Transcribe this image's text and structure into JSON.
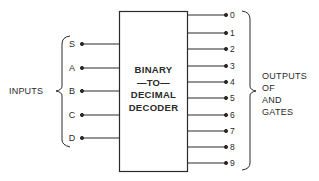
{
  "decoder": {
    "title_lines": [
      "BINARY",
      "—TO—",
      "DECIMAL",
      "DECODER"
    ]
  },
  "inputs": {
    "group_label": "INPUTS",
    "lines": [
      {
        "label": "S"
      },
      {
        "label": "A"
      },
      {
        "label": "B"
      },
      {
        "label": "C"
      },
      {
        "label": "D"
      }
    ]
  },
  "outputs": {
    "group_label_lines": [
      "OUTPUTS",
      "OF",
      "AND",
      "GATES"
    ],
    "lines": [
      {
        "label": "0"
      },
      {
        "label": "1"
      },
      {
        "label": "2"
      },
      {
        "label": "3"
      },
      {
        "label": "4"
      },
      {
        "label": "5"
      },
      {
        "label": "6"
      },
      {
        "label": "7"
      },
      {
        "label": "8"
      },
      {
        "label": "9"
      }
    ]
  },
  "colors": {
    "line": "#2a2a2a",
    "background": "#ffffff"
  }
}
